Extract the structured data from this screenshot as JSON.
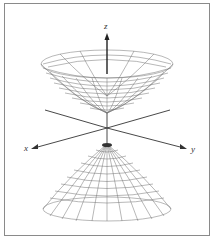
{
  "figure": {
    "type": "3d-surface-diagram",
    "surface": "hyperboloid of two sheets",
    "axes": {
      "x_label": "x",
      "y_label": "y",
      "z_label": "z"
    },
    "colors": {
      "frame": "#8a8a8a",
      "mesh": "#6e6e6e",
      "axis": "#333333",
      "background": "#ffffff"
    }
  }
}
